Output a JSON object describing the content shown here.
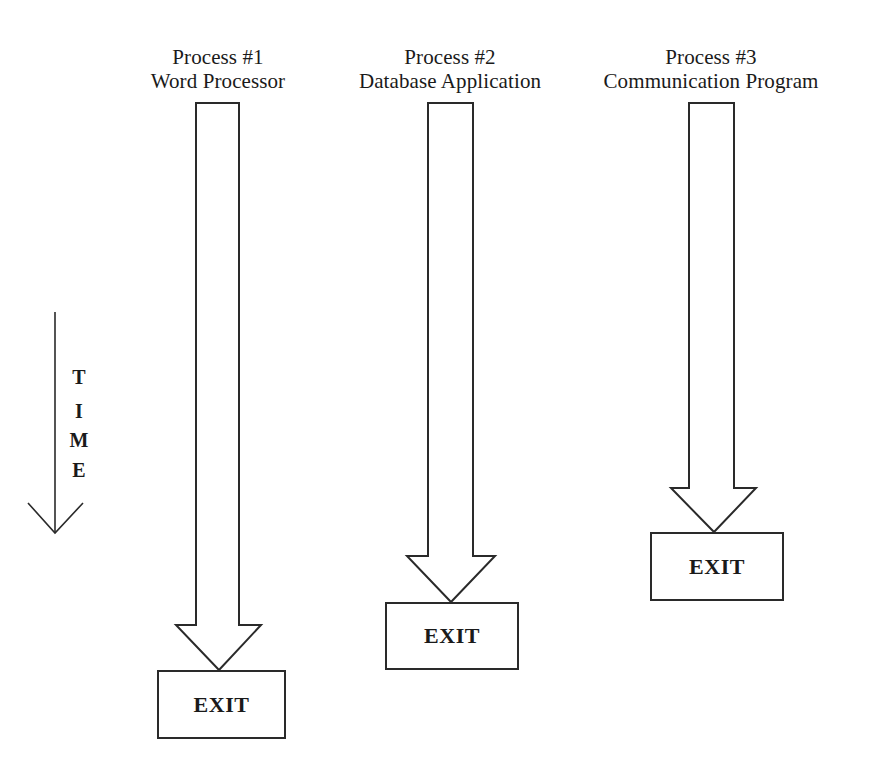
{
  "diagram": {
    "time_axis": {
      "label_letters": [
        "T",
        "I",
        "M",
        "E"
      ],
      "direction": "down"
    },
    "processes": [
      {
        "id": "process-1",
        "title": "Process #1",
        "subtitle": "Word Processor",
        "end_label": "EXIT"
      },
      {
        "id": "process-2",
        "title": "Process #2",
        "subtitle": "Database Application",
        "end_label": "EXIT"
      },
      {
        "id": "process-3",
        "title": "Process #3",
        "subtitle": "Communication Program",
        "end_label": "EXIT"
      }
    ],
    "colors": {
      "stroke": "#2a2a2a",
      "background": "#ffffff",
      "text": "#1a1a1a"
    }
  }
}
